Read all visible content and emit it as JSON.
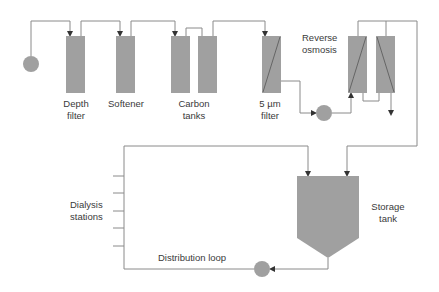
{
  "colors": {
    "component_fill": "#a0a0a0",
    "line": "#8a8a8a",
    "text": "#3a3a3a"
  },
  "components": {
    "depth_filter": {
      "label": "Depth\nfilter"
    },
    "softener": {
      "label": "Softener"
    },
    "carbon_tanks": {
      "label": "Carbon\ntanks"
    },
    "micron_filter": {
      "label": "5 µm\nfilter"
    },
    "reverse_osmosis": {
      "label": "Reverse\nosmosis"
    },
    "storage_tank": {
      "label": "Storage\ntank"
    },
    "dialysis_stations": {
      "label": "Dialysis\nstations"
    },
    "distribution_loop": {
      "label": "Distribution loop"
    }
  }
}
